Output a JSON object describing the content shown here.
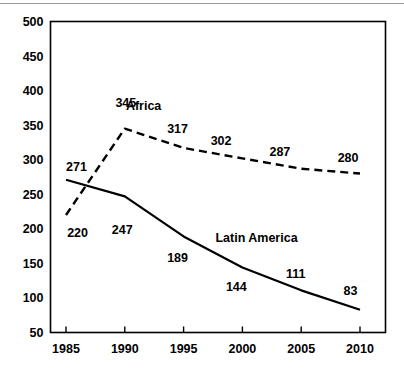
{
  "figure": {
    "has_top_rule": true,
    "background_color": "#ffffff",
    "line_color": "#000000"
  },
  "chart_data": {
    "type": "line",
    "title": "",
    "subtitle": "",
    "xlabel": "",
    "ylabel": "",
    "x": [
      1985,
      1990,
      1995,
      2000,
      2005,
      2010
    ],
    "xtick_labels": [
      "1985",
      "1990",
      "1995",
      "2000",
      "2005",
      "2010"
    ],
    "ytick_labels": [
      "50",
      "100",
      "150",
      "200",
      "250",
      "300",
      "350",
      "400",
      "450",
      "500"
    ],
    "ytick_values": [
      50,
      100,
      150,
      200,
      250,
      300,
      350,
      400,
      450,
      500
    ],
    "ylim": [
      50,
      500
    ],
    "xlim": [
      1985,
      2010
    ],
    "grid": false,
    "legend_position": "inline-annotations",
    "series": [
      {
        "name": "Africa",
        "label": "Africa",
        "style": "dashed",
        "color": "#000000",
        "values": [
          220,
          345,
          317,
          302,
          287,
          280
        ],
        "point_labels": [
          "220",
          "345",
          "317",
          "302",
          "287",
          "280"
        ]
      },
      {
        "name": "Latin America",
        "label": "Latin America",
        "style": "solid",
        "color": "#000000",
        "values": [
          271,
          247,
          189,
          144,
          111,
          83
        ],
        "point_labels": [
          "271",
          "247",
          "189",
          "144",
          "111",
          "83"
        ]
      }
    ],
    "annotations": [
      {
        "text": "Africa",
        "x": 1991.6,
        "y": 372
      },
      {
        "text": "Latin America",
        "x": 2001.2,
        "y": 181
      },
      {
        "text": "220",
        "x": 1985.1,
        "y": 188
      },
      {
        "text": "345",
        "x": 1989.2,
        "y": 377
      },
      {
        "text": "317",
        "x": 1993.6,
        "y": 338
      },
      {
        "text": "302",
        "x": 1997.3,
        "y": 322
      },
      {
        "text": "287",
        "x": 2002.3,
        "y": 305
      },
      {
        "text": "280",
        "x": 2008.1,
        "y": 296
      },
      {
        "text": "271",
        "x": 1985.0,
        "y": 284
      },
      {
        "text": "247",
        "x": 1988.9,
        "y": 192
      },
      {
        "text": "189",
        "x": 1993.6,
        "y": 152
      },
      {
        "text": "144",
        "x": 1998.6,
        "y": 110
      },
      {
        "text": "111",
        "x": 2003.7,
        "y": 129
      },
      {
        "text": "83",
        "x": 2008.6,
        "y": 104
      }
    ]
  }
}
